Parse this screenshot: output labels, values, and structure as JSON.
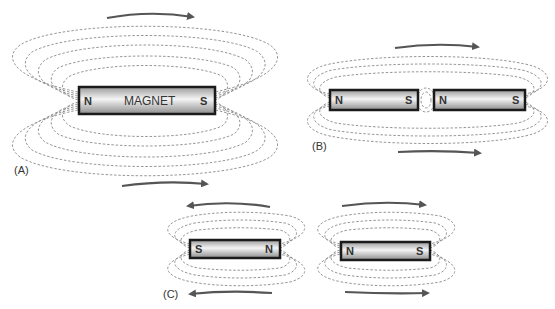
{
  "diagram": {
    "panels": [
      {
        "id": "A",
        "label": "(A)",
        "magnets": [
          {
            "name": "MAGNET",
            "left_pole": "N",
            "right_pole": "S"
          }
        ],
        "arrows": [
          {
            "position": "top",
            "direction": "right"
          },
          {
            "position": "bottom",
            "direction": "right"
          }
        ]
      },
      {
        "id": "B",
        "label": "(B)",
        "magnets": [
          {
            "left_pole": "N",
            "right_pole": "S"
          },
          {
            "left_pole": "N",
            "right_pole": "S"
          }
        ],
        "arrows": [
          {
            "position": "top",
            "direction": "right"
          },
          {
            "position": "bottom",
            "direction": "right"
          }
        ]
      },
      {
        "id": "C",
        "label": "(C)",
        "magnets": [
          {
            "left_pole": "S",
            "right_pole": "N"
          },
          {
            "left_pole": "N",
            "right_pole": "S"
          }
        ],
        "arrows": [
          {
            "position": "top-left",
            "direction": "left"
          },
          {
            "position": "top-right",
            "direction": "right"
          },
          {
            "position": "bottom-left",
            "direction": "left"
          },
          {
            "position": "bottom-right",
            "direction": "right"
          }
        ]
      }
    ],
    "colors": {
      "field_line": "#8a8a8a",
      "arrow": "#555555",
      "magnet_border": "#1a1a1a"
    }
  }
}
